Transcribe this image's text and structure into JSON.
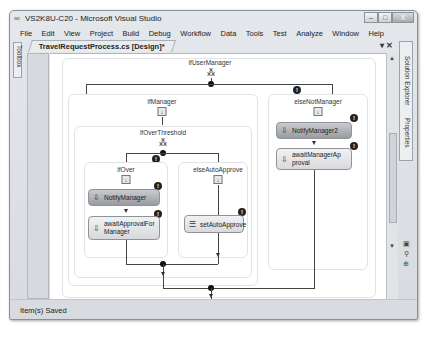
{
  "window": {
    "title": "VS2K8U-C20 - Microsoft Visual Studio",
    "title_icon": "vs-logo-icon",
    "controls": {
      "minimize": "‒",
      "maximize": "□",
      "close": "X"
    }
  },
  "menubar": {
    "items": [
      {
        "label": "File"
      },
      {
        "label": "Edit"
      },
      {
        "label": "View"
      },
      {
        "label": "Project"
      },
      {
        "label": "Build"
      },
      {
        "label": "Debug"
      },
      {
        "label": "Workflow"
      },
      {
        "label": "Data"
      },
      {
        "label": "Tools"
      },
      {
        "label": "Test"
      },
      {
        "label": "Analyze"
      },
      {
        "label": "Window"
      },
      {
        "label": "Help"
      }
    ]
  },
  "side_panels": {
    "left": "Toolbox",
    "right": "Solution Explorer",
    "right2": "Properties"
  },
  "document": {
    "tab_label": "TravelRequestProcess.cs [Design]*",
    "tab_controls": {
      "dropdown": "▾",
      "close": "✕"
    }
  },
  "workflow": {
    "root": {
      "label": "ifUserManager"
    },
    "branches": {
      "ifManager": {
        "label": "ifManager"
      },
      "elseNotManager": {
        "label": "elseNotManager"
      }
    },
    "nested": {
      "label": "ifOverThreshold",
      "ifOver": {
        "label": "ifOver"
      },
      "elseAutoApprove": {
        "label": "elseAutoApprove"
      }
    },
    "activities": {
      "notifyManager": "NotifyManager",
      "awaitApprovalForManager": "awaitApprovalFor Manager",
      "setAutoApprove": "setAutoApprove",
      "notifyManager2": "NotifyManager2",
      "awaitManagerApproval": "awaitManagerAp proval"
    },
    "warning_glyph": "!"
  },
  "statusbar": {
    "text": "Item(s) Saved"
  }
}
